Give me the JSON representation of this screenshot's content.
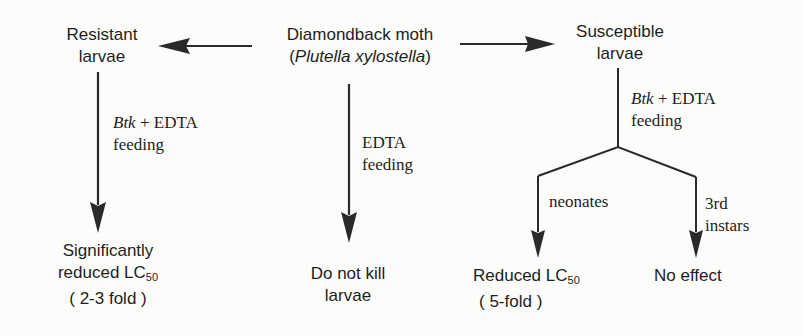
{
  "diagram": {
    "nodes": {
      "root": {
        "line1": "Diamondback moth",
        "line2_open": "(",
        "line2_italic": "Plutella xylostella",
        "line2_close": ")"
      },
      "resistant": {
        "line1": "Resistant",
        "line2": "larvae"
      },
      "susceptible": {
        "line1": "Susceptible",
        "line2": "larvae"
      },
      "resistant_outcome": {
        "line1": "Significantly",
        "line2": "reduced LC",
        "line2_sub": "50",
        "line3": "( 2-3 fold )"
      },
      "edta_outcome": {
        "line1": "Do not kill",
        "line2": "larvae"
      },
      "neonate_outcome": {
        "line1": "Reduced LC",
        "line1_sub": "50",
        "line2": "( 5-fold )"
      },
      "instar_outcome": {
        "line1": "No effect"
      }
    },
    "edge_labels": {
      "resistant_treatment": {
        "italic": "Btk",
        "rest": " + EDTA",
        "line2": "feeding"
      },
      "edta_treatment": {
        "line1": "EDTA",
        "line2": "feeding"
      },
      "susceptible_treatment": {
        "italic": "Btk",
        "rest": " + EDTA",
        "line2": "feeding"
      },
      "neonates": "neonates",
      "instars": {
        "line1": "3rd",
        "line2": "instars"
      }
    },
    "colors": {
      "ink": "#1e1e1e",
      "background": "#fcfcfa"
    }
  }
}
